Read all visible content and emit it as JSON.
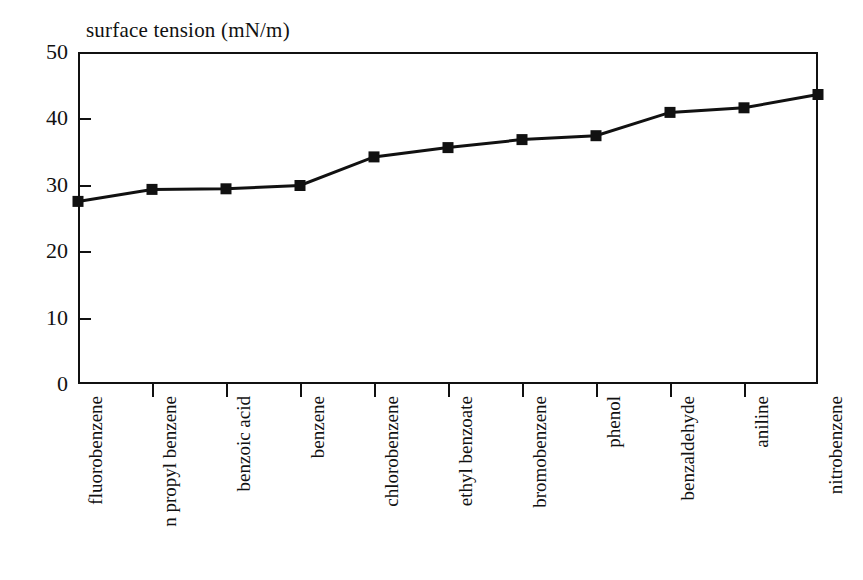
{
  "chart_data": {
    "type": "line",
    "title": "surface tension (mN/m)",
    "xlabel": "",
    "ylabel": "",
    "ylim": [
      0,
      50
    ],
    "ytick_labels": [
      "0",
      "10",
      "20",
      "30",
      "40",
      "50"
    ],
    "ytick_values": [
      0,
      10,
      20,
      30,
      40,
      50
    ],
    "grid": false,
    "legend": false,
    "marker": "filled-square",
    "line_color": "#111111",
    "marker_color": "#111111",
    "categories": [
      "fluorobenzene",
      "n propyl benzene",
      "benzoic acid",
      "benzene",
      "chlorobenzene",
      "ethyl benzoate",
      "bromobenzene",
      "phenol",
      "benzaldehyde",
      "aniline",
      "nitrobenzene"
    ],
    "values": [
      27.5,
      29.3,
      29.4,
      29.9,
      34.2,
      35.6,
      36.8,
      37.4,
      40.9,
      41.6,
      43.6
    ],
    "series": [
      {
        "name": "surface tension",
        "values": [
          27.5,
          29.3,
          29.4,
          29.9,
          34.2,
          35.6,
          36.8,
          37.4,
          40.9,
          41.6,
          43.6
        ]
      }
    ]
  },
  "figure": {
    "title": "surface tension (mN/m)"
  }
}
